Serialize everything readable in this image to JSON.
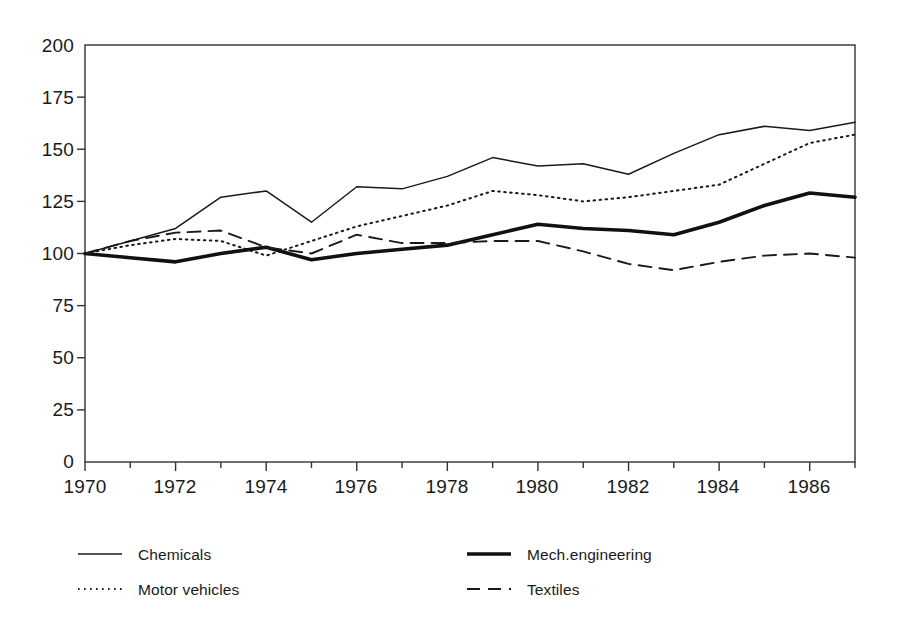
{
  "chart_data": {
    "type": "line",
    "title": "",
    "subtitle": "",
    "xlabel": "",
    "ylabel": "",
    "x": [
      1970,
      1971,
      1972,
      1973,
      1974,
      1975,
      1976,
      1977,
      1978,
      1979,
      1980,
      1981,
      1982,
      1983,
      1984,
      1985,
      1986,
      1987
    ],
    "xlim": [
      1970,
      1987
    ],
    "ylim": [
      0,
      200
    ],
    "yticks": [
      0,
      25,
      50,
      75,
      100,
      125,
      150,
      175,
      200
    ],
    "xticks": [
      1970,
      1971,
      1972,
      1973,
      1974,
      1975,
      1976,
      1977,
      1978,
      1979,
      1980,
      1981,
      1982,
      1983,
      1984,
      1985,
      1986,
      1987
    ],
    "xtick_labels_shown": [
      "1970",
      "1972",
      "1974",
      "1976",
      "1978",
      "1980",
      "1982",
      "1984",
      "1986"
    ],
    "ytick_labels": [
      "0",
      "25",
      "50",
      "75",
      "100",
      "125",
      "150",
      "175",
      "200"
    ],
    "grid": false,
    "legend_position": "bottom",
    "series": [
      {
        "name": "Chemicals",
        "style": "solid-thin",
        "color": "#1a1a1a",
        "values": [
          100,
          106,
          112,
          127,
          130,
          115,
          132,
          131,
          137,
          146,
          142,
          143,
          138,
          148,
          157,
          161,
          159,
          163
        ]
      },
      {
        "name": "Motor vehicles",
        "style": "dotted",
        "color": "#1a1a1a",
        "values": [
          100,
          104,
          107,
          106,
          99,
          106,
          113,
          118,
          123,
          130,
          128,
          125,
          127,
          130,
          133,
          143,
          153,
          157
        ]
      },
      {
        "name": "Mech.engineering",
        "style": "solid-thick",
        "color": "#111111",
        "values": [
          100,
          98,
          96,
          100,
          103,
          97,
          100,
          102,
          104,
          109,
          114,
          112,
          111,
          109,
          115,
          123,
          129,
          127
        ]
      },
      {
        "name": "Textiles",
        "style": "dashed",
        "color": "#1a1a1a",
        "values": [
          100,
          106,
          110,
          111,
          103,
          100,
          109,
          105,
          105,
          106,
          106,
          101,
          95,
          92,
          96,
          99,
          100,
          98
        ]
      }
    ]
  },
  "legend": {
    "entries": [
      {
        "label": "Chemicals",
        "style": "solid-thin"
      },
      {
        "label": "Motor vehicles",
        "style": "dotted"
      },
      {
        "label": "Mech.engineering",
        "style": "solid-thick"
      },
      {
        "label": "Textiles",
        "style": "dashed"
      }
    ]
  },
  "axes": {
    "y_labels": [
      "200",
      "175",
      "150",
      "125",
      "100",
      "75",
      "50",
      "25",
      "0"
    ],
    "x_labels": [
      "1970",
      "1972",
      "1974",
      "1976",
      "1978",
      "1980",
      "1982",
      "1984",
      "1986"
    ]
  }
}
